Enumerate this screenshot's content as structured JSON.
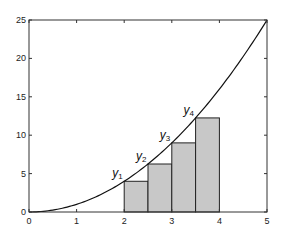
{
  "chart_data": {
    "type": "line",
    "title": "",
    "xlabel": "",
    "ylabel": "",
    "xlim": [
      0,
      5
    ],
    "ylim": [
      0,
      25
    ],
    "grid": false,
    "x_ticks": [
      "0",
      "1",
      "2",
      "3",
      "4",
      "5"
    ],
    "y_ticks": [
      "0",
      "5",
      "10",
      "15",
      "20",
      "25"
    ],
    "series": [
      {
        "name": "y = x^2",
        "type": "line",
        "function": "x^2",
        "x": [
          0,
          0.5,
          1,
          1.5,
          2,
          2.5,
          3,
          3.5,
          4,
          4.5,
          5
        ],
        "values": [
          0,
          0.25,
          1,
          2.25,
          4,
          6.25,
          9,
          12.25,
          16,
          20.25,
          25
        ]
      },
      {
        "name": "left-endpoint rectangles",
        "type": "bar",
        "x_left": [
          2,
          2.5,
          3,
          3.5
        ],
        "width": 0.5,
        "values": [
          4,
          6.25,
          9,
          12.25
        ],
        "color": "#c8c8c8"
      }
    ],
    "annotations": [
      {
        "text": "y1",
        "base": "y",
        "sub": "1",
        "x": 2,
        "y": 4
      },
      {
        "text": "y2",
        "base": "y",
        "sub": "2",
        "x": 2.5,
        "y": 6.25
      },
      {
        "text": "y3",
        "base": "y",
        "sub": "3",
        "x": 3,
        "y": 9
      },
      {
        "text": "y4",
        "base": "y",
        "sub": "4",
        "x": 3.5,
        "y": 12.25
      }
    ]
  }
}
